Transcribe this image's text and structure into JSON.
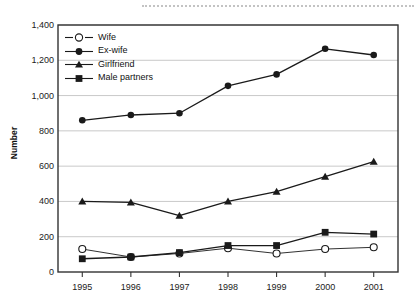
{
  "figure": {
    "y_axis_title": "Number",
    "scan_artifact": "dotted-line-artifact"
  },
  "chart_data": {
    "type": "line",
    "title": "",
    "subtitle": "",
    "xlabel": "",
    "ylabel": "Number",
    "categories": [
      "1995",
      "1996",
      "1997",
      "1998",
      "1999",
      "2000",
      "2001"
    ],
    "x_tick_labels": [
      "1995",
      "1996",
      "1997",
      "1998",
      "1999",
      "2000",
      "2001"
    ],
    "y_tick_labels": [
      "0",
      "200",
      "400",
      "600",
      "800",
      "1,000",
      "1,200",
      "1,400"
    ],
    "y_ticks": [
      0,
      200,
      400,
      600,
      800,
      1000,
      1200,
      1400
    ],
    "ylim": [
      0,
      1400
    ],
    "grid": "horizontal",
    "legend_position": "upper-left-inside",
    "series": [
      {
        "name": "Wife",
        "marker": "open-circle",
        "color": "#1a1a1a",
        "values": [
          130,
          85,
          105,
          135,
          105,
          130,
          140
        ]
      },
      {
        "name": "Ex-wife",
        "marker": "filled-circle",
        "color": "#1a1a1a",
        "values": [
          860,
          890,
          900,
          1055,
          1120,
          1265,
          1230
        ]
      },
      {
        "name": "Girlfriend",
        "marker": "filled-triangle",
        "color": "#1a1a1a",
        "values": [
          400,
          395,
          320,
          400,
          455,
          540,
          625
        ]
      },
      {
        "name": "Male partners",
        "marker": "filled-square",
        "color": "#1a1a1a",
        "values": [
          75,
          85,
          110,
          150,
          150,
          225,
          215
        ]
      }
    ]
  },
  "legend": {
    "items": [
      {
        "label": "Wife",
        "marker": "open-circle"
      },
      {
        "label": "Ex-wife",
        "marker": "filled-circle"
      },
      {
        "label": "Girlfriend",
        "marker": "filled-triangle"
      },
      {
        "label": "Male partners",
        "marker": "filled-square"
      }
    ]
  },
  "colors": {
    "ink": "#1a1a1a",
    "gridline": "#c9c9c9",
    "frame": "#333333",
    "background": "#ffffff"
  }
}
